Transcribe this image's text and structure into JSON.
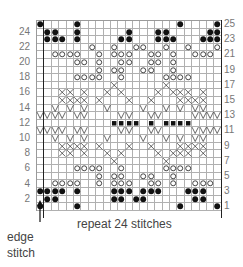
{
  "chart": {
    "columns": 25,
    "rows": 25,
    "symbols": {
      ".": "knit-empty",
      "B": "filled-dot",
      "O": "open-circle",
      "X": "cross",
      "V": "v-shape",
      "S": "small-square"
    },
    "grid_top_to_bottom": [
      "B....B.............B....B",
      ".BB..B......B...BB.....BB",
      ".BBB.B.....BB...BBB...BBB",
      ".......O..O..OO..O..O...O",
      "..OOOO..O.OOO..OO.O..OOO.",
      ".....OO.O..OO..OO.O......",
      "........O.OO..OO..O......",
      ".....OOOO..O.....OOOO....",
      "..........X......X.......",
      "...XX.X..X.X....X.XXX.X..",
      "...XXXX.X...X..X...XXXX..",
      "..V.V.V..V....V..V.V.VV..",
      "VVVV.VV....VV..VV....VVVV",
      "..........SSSS.S.SSSS....",
      "VVVV.VV....VV..VV....VVVV",
      "..V.V.V..V....V..V.V.VV..",
      "...XXXX.X...X..X...XXXX..",
      "...XX.X..X.X....X.XXX.X..",
      "..........X......X.......",
      ".....OOOO..O.....OOOO....",
      "........O.OO..OO..O......",
      "..OOOO..O.OOO..OO.O..OOO.",
      "BBBB.B....BBB.BBB...BBB..",
      ".BB.......BB.BB......BB..",
      "B....B.............B....B"
    ],
    "row_numbers_left": [
      "24",
      "22",
      "20",
      "18",
      "16",
      "14",
      "12",
      "10",
      "8",
      "6",
      "4",
      "2"
    ],
    "row_numbers_right": [
      "25",
      "23",
      "21",
      "19",
      "17",
      "15",
      "13",
      "11",
      "9",
      "7",
      "5",
      "3",
      "1"
    ]
  },
  "labels": {
    "repeat": "repeat 24 stitches",
    "edge_line1": "edge",
    "edge_line2": "stitch"
  },
  "colors": {
    "ink": "#111111",
    "grid": "#b0b0b0",
    "label": "#777777"
  }
}
